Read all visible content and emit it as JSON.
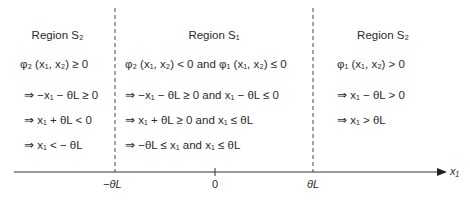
{
  "diagram": {
    "axis": {
      "variable": "x₁",
      "ticks": [
        {
          "label": "−θL",
          "x": 115
        },
        {
          "label": "0",
          "x": 215
        },
        {
          "label": "θL",
          "x": 313
        }
      ]
    },
    "regions": [
      {
        "title": "Region S₂",
        "rows": [
          "φ₂ (x₁, x₂) ≥ 0",
          "⇒ −x₁ − θL ≥ 0",
          "⇒ x₁ + θL < 0",
          "⇒ x₁ < − θL"
        ]
      },
      {
        "title": "Region S₁",
        "rows": [
          "φ₂ (x₁, x₂) < 0 and φ₁ (x₁, x₂) ≤ 0",
          "⇒ −x₁ − θL ≥ 0 and x₁ − θL ≤ 0",
          "⇒ x₁ + θL ≥ 0 and x₁ ≤ θL",
          "⇒ −θL ≤ x₁ and x₁ ≤ θL"
        ]
      },
      {
        "title": "Region S₂",
        "rows": [
          "φ₁ (x₁, x₂) > 0",
          "⇒ x₁ − θL > 0",
          "⇒ x₁ > θL"
        ]
      }
    ],
    "colors": {
      "text": "#2b2b2b",
      "lines": "#333333"
    }
  }
}
